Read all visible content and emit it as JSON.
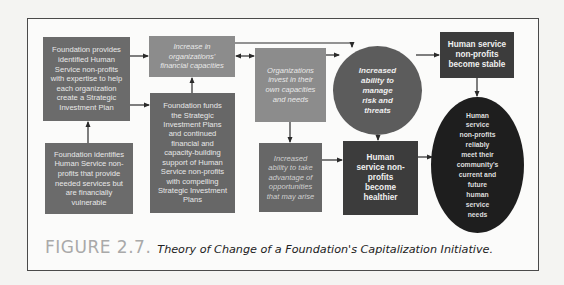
{
  "figure": {
    "label": "FIGURE 2.7.",
    "title": "Theory of Change of a Foundation's Capitalization Initiative."
  },
  "nodes": {
    "provides_expertise": {
      "lines": [
        "Foundation provides",
        "identified Human",
        "Service non-profits",
        "with expertise to help",
        "each organization",
        "create a Strategic",
        "Investment Plan"
      ]
    },
    "identifies_nonprofits": {
      "lines": [
        "Foundation identifies",
        "Human Service non-",
        "profits that provide",
        "needed services but",
        "are financially",
        "vulnerable"
      ]
    },
    "increase_financial_capacities": {
      "lines": [
        "Increase in",
        "organizations'",
        "financial capacities"
      ]
    },
    "funds_plans": {
      "lines": [
        "Foundation funds",
        "the Strategic",
        "Investment Plans",
        "and continued",
        "financial and",
        "capacity-building",
        "support of Human",
        "Service non-profits",
        "with compelling",
        "Strategic Investment",
        "Plans"
      ]
    },
    "invest_own_capacities": {
      "lines": [
        "Organizations",
        "invest in their",
        "own capacities",
        "and needs"
      ]
    },
    "take_advantage_opportunities": {
      "lines": [
        "Increased",
        "ability to take",
        "advantage of",
        "opportunities",
        "that may arise"
      ]
    },
    "manage_risk": {
      "lines": [
        "Increased",
        "ability to",
        "manage",
        "risk and",
        "threats"
      ]
    },
    "become_healthier": {
      "lines": [
        "Human",
        "service non-",
        "profits",
        "become",
        "healthier"
      ]
    },
    "become_stable": {
      "lines": [
        "Human service",
        "non-profits",
        "become stable"
      ]
    },
    "meet_needs": {
      "lines": [
        "Human",
        "service",
        "non-profits",
        "reliably",
        "meet their",
        "community's",
        "current and",
        "future",
        "human",
        "service",
        "needs"
      ]
    }
  },
  "colors": {
    "frame_border": "#4a4a4a",
    "medium_gray": "#6b6b6b",
    "light_gray": "#8c8c8c",
    "circle_gray": "#5c5c5c",
    "dark_gray": "#3c3c3c",
    "near_black": "#1e1e1e",
    "caption_label": "#a9a9a9"
  }
}
